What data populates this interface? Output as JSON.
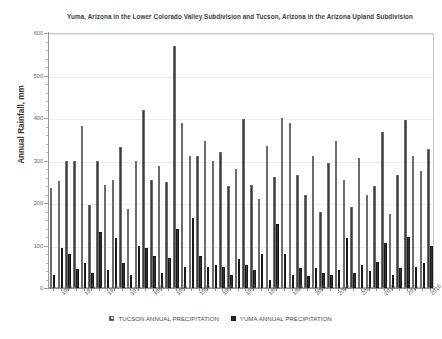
{
  "chart_data": {
    "type": "bar",
    "title": "Yuma, Arizona in the Lower Colorado Valley Subdivision and Tucson, Arizona in the Arizona Upland Subdivision",
    "xlabel": "",
    "ylabel": "Annual Rainfall, mm",
    "ylim": [
      0,
      600
    ],
    "ytick_step": 100,
    "yticks": [
      0,
      100,
      200,
      300,
      400,
      500,
      600
    ],
    "ytick_labels": [
      "0",
      "100",
      "200",
      "300",
      "400",
      "500",
      "600"
    ],
    "grid": true,
    "legend_position": "bottom",
    "categories": [
      "1967",
      "1968",
      "1969",
      "1970",
      "1971",
      "1972",
      "1973",
      "1974",
      "1975",
      "1976",
      "1977",
      "1978",
      "1979",
      "1980",
      "1981",
      "1982",
      "1983",
      "1984",
      "1985",
      "1986",
      "1987",
      "1988",
      "1989",
      "1990",
      "1991",
      "1992",
      "1993",
      "1994",
      "1995",
      "1996",
      "1997",
      "1998",
      "1999",
      "2000",
      "2001",
      "2002",
      "2003",
      "2004",
      "2005",
      "2006",
      "2007",
      "2008",
      "2009",
      "2010",
      "2011",
      "2012",
      "2013",
      "2014",
      "2015",
      "2016"
    ],
    "xtick_labels": [
      "1968",
      "1971",
      "1974",
      "1977",
      "1980",
      "1983",
      "1986",
      "1989",
      "1992",
      "1995",
      "1998",
      "2001",
      "2004",
      "2007",
      "2010",
      "2013",
      "2016"
    ],
    "xtick_indices": [
      1,
      4,
      7,
      10,
      13,
      16,
      19,
      22,
      25,
      28,
      31,
      34,
      37,
      40,
      43,
      46,
      49
    ],
    "series": [
      {
        "name": "TUCSON ANNUAL PRECIPITATION",
        "style": "checkered-hatch",
        "color": "#3d3d3d",
        "values": [
          235,
          252,
          300,
          300,
          382,
          195,
          300,
          243,
          255,
          332,
          185,
          300,
          420,
          255,
          288,
          250,
          570,
          388,
          310,
          311,
          345,
          300,
          320,
          240,
          280,
          398,
          242,
          210,
          333,
          262,
          400,
          388,
          265,
          220,
          310,
          180,
          295,
          345,
          255,
          190,
          307,
          220,
          240,
          368,
          175,
          265,
          395,
          310,
          275,
          328
        ]
      },
      {
        "name": "YUMA ANNUAL PRECIPITATION",
        "style": "solid",
        "color": "#333333",
        "values": [
          30,
          95,
          80,
          45,
          60,
          35,
          132,
          42,
          118,
          60,
          30,
          100,
          95,
          75,
          35,
          70,
          138,
          50,
          165,
          75,
          50,
          55,
          50,
          30,
          68,
          55,
          42,
          80,
          20,
          150,
          80,
          30,
          48,
          28,
          46,
          35,
          30,
          42,
          118,
          35,
          55,
          40,
          62,
          105,
          30,
          48,
          120,
          50,
          58,
          98
        ]
      }
    ]
  },
  "legend": {
    "entries": [
      {
        "label": "TUCSON ANNUAL PRECIPITATION",
        "swatch": "checkered-swatch"
      },
      {
        "label": "YUMA ANNUAL PRECIPITATION",
        "swatch": "solid-swatch"
      }
    ]
  }
}
